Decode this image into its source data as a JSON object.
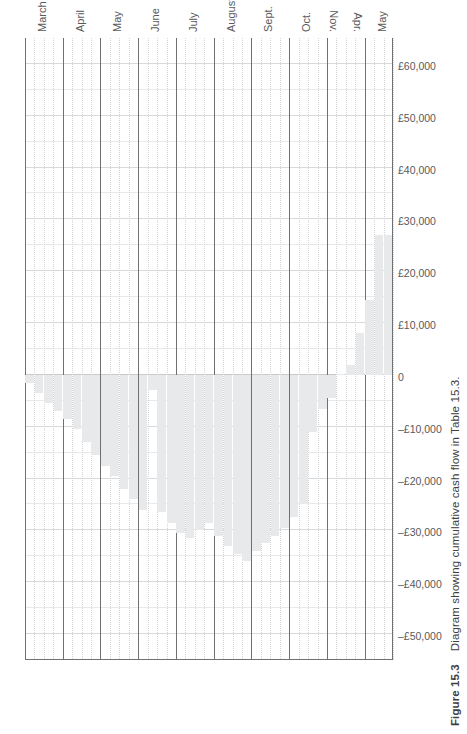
{
  "figure": {
    "number": "Figure 15.3",
    "caption": "Diagram showing cumulative cash flow in Table 15.3."
  },
  "chart_data": {
    "type": "bar",
    "title": "Diagram showing cumulative cash flow in Table 15.3.",
    "orientation": "vertical",
    "xlabel": "",
    "ylabel": "",
    "grid": true,
    "legend": "none",
    "ylim": [
      -55000,
      65000
    ],
    "yticks": [
      60000,
      50000,
      40000,
      30000,
      20000,
      10000,
      0,
      -10000,
      -20000,
      -30000,
      -40000,
      -50000
    ],
    "ytick_labels": [
      "£60,000",
      "£50,000",
      "£40,000",
      "£30,000",
      "£20,000",
      "£10,000",
      "0",
      "–£10,000",
      "–£20,000",
      "–£30,000",
      "–£40,000",
      "–£50,000"
    ],
    "month_groups": [
      "March",
      "April",
      "May",
      "June",
      "July",
      "August",
      "Sept.",
      "Oct.",
      "Nov.",
      "Apr.",
      "May"
    ],
    "categories": [
      "March w1",
      "March w2",
      "March w3",
      "March w4",
      "April w1",
      "April w2",
      "April w3",
      "April w4",
      "May w1",
      "May w2",
      "May w3",
      "May w4",
      "June w1",
      "June w2",
      "June w3",
      "June w4",
      "July w1",
      "July w2",
      "July w3",
      "July w4",
      "August w1",
      "August w2",
      "August w3",
      "August w4",
      "Sept. w1",
      "Sept. w2",
      "Sept. w3",
      "Sept. w4",
      "Oct. w1",
      "Oct. w2",
      "Oct. w3",
      "Oct. w4",
      "Nov. w1",
      "Nov. w2",
      "Apr. w1",
      "Apr. w2",
      "Apr. w3",
      "May w1",
      "May w2"
    ],
    "values": [
      -1500,
      -3500,
      -5500,
      -7000,
      -8500,
      -10500,
      -13000,
      -15500,
      -17500,
      -19500,
      -22000,
      -24000,
      -26000,
      -3000,
      -26500,
      -28500,
      -30500,
      -31500,
      -30000,
      -28500,
      -31000,
      -33000,
      -34500,
      -36000,
      -34000,
      -32500,
      -31000,
      -29500,
      -27500,
      -25000,
      -11000,
      -6500,
      -4500,
      0,
      2000,
      8000,
      14500,
      27000,
      27000
    ]
  }
}
